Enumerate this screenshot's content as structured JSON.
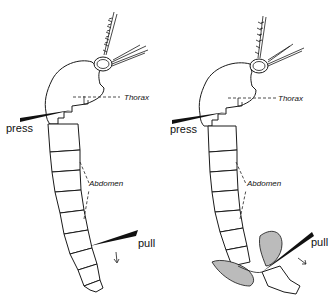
{
  "figure": {
    "panels": [
      {
        "id": "left",
        "labels": {
          "thorax": "Thorax",
          "abdomen": "Abdomen",
          "press": "press",
          "pull": "pull"
        }
      },
      {
        "id": "right",
        "labels": {
          "thorax": "Thorax",
          "abdomen": "Abdomen",
          "press": "press",
          "pull": "pull"
        }
      }
    ],
    "colors": {
      "line": "#1a1a1a",
      "background": "#ffffff"
    }
  }
}
